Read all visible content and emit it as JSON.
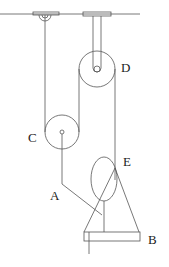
{
  "diagram": {
    "type": "pulley-system",
    "labels": {
      "A": "A",
      "B": "B",
      "C": "C",
      "D": "D",
      "E": "E"
    },
    "components": [
      {
        "id": "ceiling",
        "desc": "horizontal ceiling line"
      },
      {
        "id": "hook-left",
        "desc": "ceiling hook at left anchoring rope end"
      },
      {
        "id": "pulley-D",
        "desc": "fixed pulley hung from ceiling bracket"
      },
      {
        "id": "pulley-C",
        "desc": "movable pulley"
      },
      {
        "id": "rope-A",
        "desc": "rope from pulley C axle down to person"
      },
      {
        "id": "person-E",
        "desc": "person (oval head/body) standing on platform"
      },
      {
        "id": "platform-B",
        "desc": "platform/board with triangular support"
      }
    ],
    "colors": {
      "line": "#555555",
      "background": "#ffffff"
    }
  }
}
